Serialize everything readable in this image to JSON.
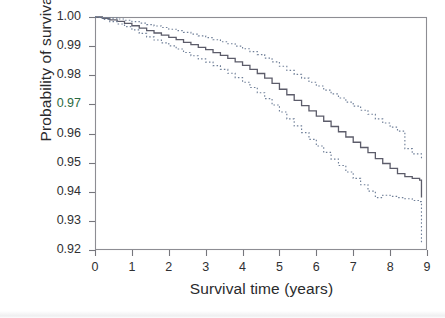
{
  "figure": {
    "background_color": "#ffffff",
    "plot_area": {
      "left": 95,
      "top": 17,
      "right": 427,
      "bottom": 250
    },
    "border_color": "#8d8d93"
  },
  "axes": {
    "x_title": "Survival time (years)",
    "y_title": "Probability of survival",
    "x_ticks": [
      "0",
      "1",
      "2",
      "3",
      "4",
      "5",
      "6",
      "7",
      "8",
      "9"
    ],
    "y_ticks": [
      "1.00",
      "0.99",
      "0.98",
      "0.97",
      "0.96",
      "0.95",
      "0.94",
      "0.93",
      "0.92"
    ],
    "y_tick_tinted_index": 3,
    "tick_color": "#76767c"
  },
  "chart_data": {
    "type": "line",
    "title": "",
    "subtitle": "",
    "xlabel": "Survival time (years)",
    "ylabel": "Probability of survival",
    "xlim": [
      0,
      9
    ],
    "ylim": [
      0.92,
      1.0
    ],
    "grid": false,
    "legend": "none",
    "step_style": "kaplan-meier step function",
    "annotations": [],
    "series": [
      {
        "name": "Survival estimate",
        "style": "solid",
        "color": "#5c5c6a",
        "x": [
          0.0,
          0.2,
          0.4,
          0.6,
          0.8,
          1.0,
          1.2,
          1.4,
          1.6,
          1.8,
          2.0,
          2.2,
          2.4,
          2.6,
          2.8,
          3.0,
          3.2,
          3.4,
          3.6,
          3.8,
          4.0,
          4.2,
          4.4,
          4.6,
          4.8,
          5.0,
          5.2,
          5.4,
          5.6,
          5.8,
          6.0,
          6.2,
          6.4,
          6.6,
          6.8,
          7.0,
          7.2,
          7.4,
          7.6,
          7.8,
          8.0,
          8.2,
          8.4,
          8.6,
          8.8,
          8.85
        ],
        "y": [
          1.0,
          0.9995,
          0.999,
          0.9985,
          0.9978,
          0.997,
          0.9962,
          0.9953,
          0.9945,
          0.9938,
          0.993,
          0.9922,
          0.9913,
          0.9905,
          0.9896,
          0.9888,
          0.9878,
          0.9868,
          0.9858,
          0.9846,
          0.9834,
          0.982,
          0.9806,
          0.979,
          0.9772,
          0.9752,
          0.9733,
          0.9714,
          0.9696,
          0.9678,
          0.966,
          0.9642,
          0.9624,
          0.9606,
          0.9588,
          0.957,
          0.9552,
          0.9534,
          0.9514,
          0.9497,
          0.948,
          0.9462,
          0.9452,
          0.9446,
          0.944,
          0.938
        ]
      },
      {
        "name": "Upper 95% confidence limit",
        "style": "dotted",
        "color": "#6f7f98",
        "x": [
          0.0,
          0.2,
          0.4,
          0.6,
          0.8,
          1.0,
          1.2,
          1.4,
          1.6,
          1.8,
          2.0,
          2.2,
          2.4,
          2.6,
          2.8,
          3.0,
          3.2,
          3.4,
          3.6,
          3.8,
          4.0,
          4.2,
          4.4,
          4.6,
          4.8,
          5.0,
          5.2,
          5.4,
          5.6,
          5.8,
          6.0,
          6.2,
          6.4,
          6.6,
          6.8,
          7.0,
          7.2,
          7.4,
          7.6,
          7.8,
          8.0,
          8.2,
          8.4,
          8.6,
          8.85
        ],
        "y": [
          1.0,
          0.9998,
          0.9996,
          0.9993,
          0.9989,
          0.9984,
          0.9979,
          0.9974,
          0.9969,
          0.9964,
          0.9958,
          0.9953,
          0.9947,
          0.9941,
          0.9935,
          0.9929,
          0.9922,
          0.9915,
          0.9908,
          0.99,
          0.9891,
          0.9881,
          0.9871,
          0.9859,
          0.9846,
          0.9831,
          0.9817,
          0.9803,
          0.979,
          0.9776,
          0.9763,
          0.9749,
          0.9736,
          0.9722,
          0.9708,
          0.9694,
          0.968,
          0.9666,
          0.965,
          0.9636,
          0.9622,
          0.9608,
          0.9548,
          0.953,
          0.951
        ]
      },
      {
        "name": "Lower 95% confidence limit",
        "style": "dotted",
        "color": "#6f7f98",
        "x": [
          0.0,
          0.2,
          0.4,
          0.6,
          0.8,
          1.0,
          1.2,
          1.4,
          1.6,
          1.8,
          2.0,
          2.2,
          2.4,
          2.6,
          2.8,
          3.0,
          3.2,
          3.4,
          3.6,
          3.8,
          4.0,
          4.2,
          4.4,
          4.6,
          4.8,
          5.0,
          5.2,
          5.4,
          5.6,
          5.8,
          6.0,
          6.2,
          6.4,
          6.6,
          6.8,
          7.0,
          7.2,
          7.4,
          7.6,
          7.8,
          8.0,
          8.2,
          8.4,
          8.6,
          8.8,
          8.85
        ],
        "y": [
          1.0,
          0.9992,
          0.9984,
          0.9976,
          0.9967,
          0.9956,
          0.9944,
          0.9932,
          0.9921,
          0.9911,
          0.9901,
          0.989,
          0.9878,
          0.9867,
          0.9856,
          0.9845,
          0.9833,
          0.982,
          0.9807,
          0.9792,
          0.9776,
          0.9758,
          0.974,
          0.972,
          0.9698,
          0.9674,
          0.965,
          0.9626,
          0.9603,
          0.958,
          0.9557,
          0.9535,
          0.9512,
          0.949,
          0.9468,
          0.9446,
          0.9424,
          0.9402,
          0.938,
          0.9388,
          0.9384,
          0.938,
          0.9376,
          0.937,
          0.9366,
          0.9222
        ]
      }
    ]
  }
}
